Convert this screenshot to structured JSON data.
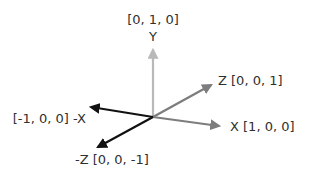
{
  "diagram": {
    "origin": {
      "x": 153,
      "y": 117
    },
    "colors": {
      "y_axis": "#b9b9b9",
      "positive_axes": "#7d7d7d",
      "negative_axes": "#111111",
      "text": "#2f2f2f"
    },
    "axes": [
      {
        "id": "y",
        "label": "Y",
        "vector": "[0, 1, 0]",
        "tip": {
          "x": 153,
          "y": 48
        }
      },
      {
        "id": "z",
        "label": "Z [0, 0, 1]",
        "tip": {
          "x": 213,
          "y": 84
        }
      },
      {
        "id": "x",
        "label": "X  [1, 0, 0]",
        "tip": {
          "x": 221,
          "y": 126
        }
      },
      {
        "id": "neg-x",
        "label": "[-1, 0, 0] -X",
        "tip": {
          "x": 89,
          "y": 107
        }
      },
      {
        "id": "neg-z",
        "label": "-Z [0, 0, -1]",
        "tip": {
          "x": 96,
          "y": 149
        }
      }
    ]
  }
}
